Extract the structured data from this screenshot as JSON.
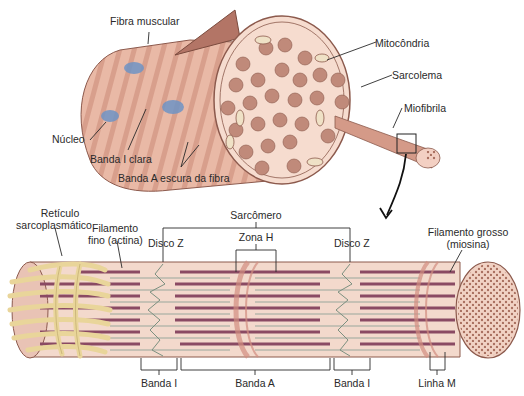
{
  "top_figure": {
    "labels": {
      "fibra_muscular": "Fibra muscular",
      "mitocondria": "Mitocôndria",
      "sarcolema": "Sarcolema",
      "miofibrila": "Miofibrila",
      "nucleo": "Núcleo",
      "banda_i_clara": "Banda I clara",
      "banda_a_escura": "Banda A escura da fibra"
    }
  },
  "bottom_figure": {
    "labels": {
      "reticulo_l1": "Retículo",
      "reticulo_l2": "sarcoplasmático",
      "filamento_fino_l1": "Filamento",
      "filamento_fino_l2": "fino (actina)",
      "disco_z_left": "Disco Z",
      "sarcomero": "Sarcômero",
      "zona_h": "Zona H",
      "disco_z_right": "Disco Z",
      "filamento_grosso_l1": "Filamento grosso",
      "filamento_grosso_l2": "(miosina)",
      "banda_i_left": "Banda I",
      "banda_a": "Banda A",
      "banda_i_right": "Banda I",
      "linha_m": "Linha M"
    }
  },
  "colors": {
    "fiber_base": "#e9b9a6",
    "fiber_stripe": "#c98d7e",
    "cross_section": "#f6dccf",
    "myofibril_dot": "#a9705f",
    "nucleus": "#6f93c4",
    "reticulum": "#e9d59a",
    "thick_filament": "#8a4a63",
    "thin_filament": "#9aa79b",
    "sarcomere_bg": "#f3d9cc",
    "leader_line": "#2a2a2a"
  }
}
